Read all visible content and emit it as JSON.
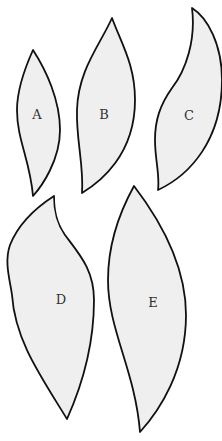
{
  "diagram": {
    "background": "#ffffff",
    "shape_fill": "#efefef",
    "stroke_color": "#111111",
    "shapes": [
      {
        "id": "A",
        "label": "A"
      },
      {
        "id": "B",
        "label": "B"
      },
      {
        "id": "C",
        "label": "C"
      },
      {
        "id": "D",
        "label": "D"
      },
      {
        "id": "E",
        "label": "E"
      }
    ]
  }
}
